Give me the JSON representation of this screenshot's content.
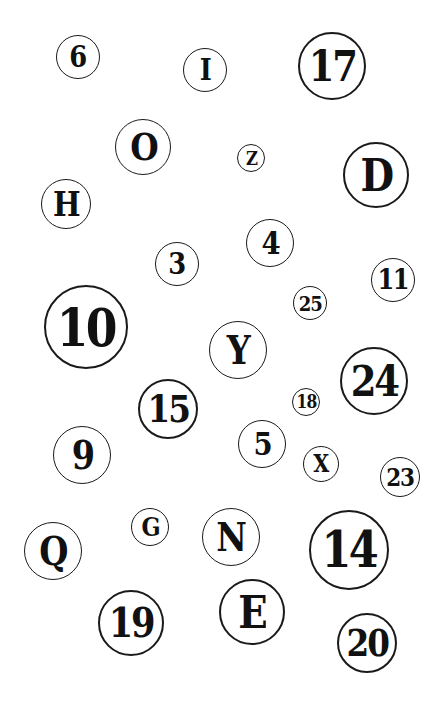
{
  "board": {
    "background": "#ffffff",
    "ink_color": "#111111",
    "tokens": [
      {
        "label": "6",
        "cx": 78,
        "cy": 57,
        "r": 22
      },
      {
        "label": "I",
        "cx": 205,
        "cy": 70,
        "r": 22
      },
      {
        "label": "17",
        "cx": 332,
        "cy": 66,
        "r": 34
      },
      {
        "label": "O",
        "cx": 143,
        "cy": 147,
        "r": 28
      },
      {
        "label": "Z",
        "cx": 251,
        "cy": 158,
        "r": 14
      },
      {
        "label": "D",
        "cx": 376,
        "cy": 175,
        "r": 33
      },
      {
        "label": "H",
        "cx": 66,
        "cy": 204,
        "r": 25
      },
      {
        "label": "4",
        "cx": 270,
        "cy": 243,
        "r": 24
      },
      {
        "label": "3",
        "cx": 177,
        "cy": 264,
        "r": 22
      },
      {
        "label": "11",
        "cx": 393,
        "cy": 280,
        "r": 22
      },
      {
        "label": "25",
        "cx": 310,
        "cy": 303,
        "r": 17
      },
      {
        "label": "10",
        "cx": 86,
        "cy": 327,
        "r": 42
      },
      {
        "label": "Y",
        "cx": 238,
        "cy": 350,
        "r": 29
      },
      {
        "label": "24",
        "cx": 374,
        "cy": 381,
        "r": 34
      },
      {
        "label": "18",
        "cx": 306,
        "cy": 402,
        "r": 14
      },
      {
        "label": "15",
        "cx": 168,
        "cy": 409,
        "r": 30
      },
      {
        "label": "5",
        "cx": 262,
        "cy": 444,
        "r": 24
      },
      {
        "label": "9",
        "cx": 82,
        "cy": 455,
        "r": 29
      },
      {
        "label": "X",
        "cx": 321,
        "cy": 464,
        "r": 18
      },
      {
        "label": "23",
        "cx": 400,
        "cy": 477,
        "r": 20
      },
      {
        "label": "G",
        "cx": 150,
        "cy": 527,
        "r": 19
      },
      {
        "label": "N",
        "cx": 231,
        "cy": 537,
        "r": 29
      },
      {
        "label": "Q",
        "cx": 53,
        "cy": 551,
        "r": 29
      },
      {
        "label": "14",
        "cx": 349,
        "cy": 550,
        "r": 40
      },
      {
        "label": "E",
        "cx": 252,
        "cy": 612,
        "r": 33
      },
      {
        "label": "19",
        "cx": 131,
        "cy": 623,
        "r": 33
      },
      {
        "label": "20",
        "cx": 367,
        "cy": 643,
        "r": 30
      }
    ]
  }
}
